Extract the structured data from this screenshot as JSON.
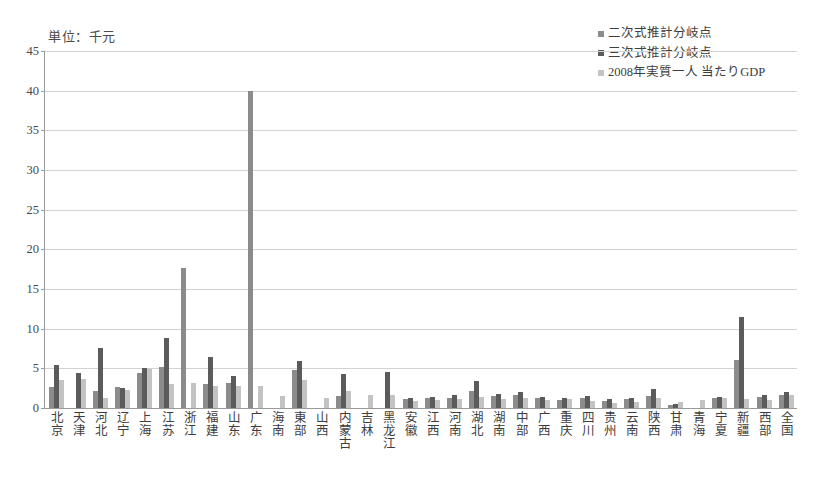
{
  "unit_caption": "単位：千元",
  "colors": {
    "series_quadratic": "#8b8b8b",
    "series_cubic": "#5b5b5b",
    "series_gdp": "#c3c3c3",
    "axis": "#9a9a9a",
    "grid": "#d2d2d2"
  },
  "legend": {
    "items": [
      {
        "label": "二次式推計分岐点",
        "color": "#8b8b8b"
      },
      {
        "label": "三次式推計分岐点",
        "color": "#5b5b5b"
      },
      {
        "label": "2008年実質一人 当たりGDP",
        "color": "#c3c3c3"
      }
    ]
  },
  "chart_data": {
    "type": "bar",
    "title": "",
    "subtitle": "",
    "xlabel": "",
    "ylabel": "単位：千元",
    "ylim": [
      0,
      45
    ],
    "yticks": [
      0,
      5,
      10,
      15,
      20,
      25,
      30,
      35,
      40,
      45
    ],
    "grid": true,
    "legend_position": "top-right",
    "categories": [
      "北京",
      "天津",
      "河北",
      "辽宁",
      "上海",
      "江苏",
      "浙江",
      "福建",
      "山东",
      "广东",
      "海南",
      "東部",
      "山西",
      "内蒙古",
      "吉林",
      "黑龙江",
      "安徽",
      "江西",
      "河南",
      "湖北",
      "湖南",
      "中部",
      "广西",
      "重庆",
      "四川",
      "贵州",
      "云南",
      "陕西",
      "甘肃",
      "青海",
      "宁夏",
      "新疆",
      "西部",
      "全国"
    ],
    "series": [
      {
        "name": "二次式推計分岐点",
        "color": "#8b8b8b",
        "values": [
          2.7,
          0.0,
          2.1,
          2.6,
          4.4,
          5.2,
          17.7,
          3.0,
          3.2,
          40.0,
          0.0,
          4.8,
          0.0,
          1.5,
          0.0,
          0.0,
          1.1,
          1.2,
          1.3,
          2.2,
          1.5,
          1.7,
          1.2,
          1.0,
          1.2,
          0.9,
          1.1,
          1.5,
          0.4,
          0.0,
          1.2,
          6.0,
          1.4,
          1.6
        ]
      },
      {
        "name": "三次式推計分岐点",
        "color": "#5b5b5b",
        "values": [
          5.4,
          4.4,
          7.6,
          2.5,
          5.1,
          8.8,
          0.0,
          6.4,
          4.0,
          0.0,
          0.0,
          5.9,
          0.0,
          4.3,
          0.0,
          4.6,
          1.3,
          1.4,
          1.6,
          3.4,
          1.8,
          2.0,
          1.4,
          1.2,
          1.5,
          1.1,
          1.3,
          2.4,
          0.5,
          0.0,
          1.4,
          11.5,
          1.7,
          2.0
        ]
      },
      {
        "name": "2008年実質一人 当たりGDP",
        "color": "#c3c3c3",
        "values": [
          3.5,
          3.6,
          1.2,
          2.3,
          4.9,
          3.0,
          3.1,
          2.8,
          2.8,
          2.8,
          1.5,
          3.5,
          1.3,
          2.2,
          1.6,
          1.7,
          0.9,
          1.0,
          1.1,
          1.4,
          1.1,
          1.2,
          1.0,
          1.1,
          0.9,
          0.6,
          0.8,
          1.2,
          0.7,
          1.0,
          1.3,
          1.1,
          1.0,
          1.7
        ]
      }
    ]
  }
}
